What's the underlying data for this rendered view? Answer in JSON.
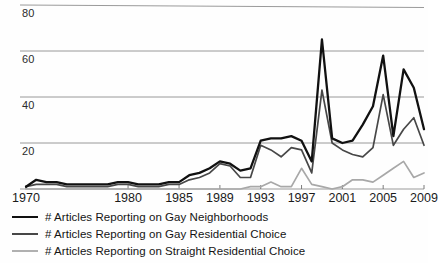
{
  "chart_data": {
    "type": "line",
    "title": "",
    "subtitle": "",
    "xlabel": "",
    "ylabel": "",
    "xlim": [
      1970,
      2009
    ],
    "ylim": [
      0,
      88
    ],
    "grid": true,
    "grid_axis": "y",
    "legend_position": "below-left",
    "x": [
      1970,
      1971,
      1972,
      1973,
      1974,
      1975,
      1976,
      1977,
      1978,
      1979,
      1980,
      1981,
      1982,
      1983,
      1984,
      1985,
      1986,
      1987,
      1988,
      1989,
      1990,
      1991,
      1992,
      1993,
      1994,
      1995,
      1996,
      1997,
      1998,
      1999,
      2000,
      2001,
      2002,
      2003,
      2004,
      2005,
      2006,
      2007,
      2008,
      2009
    ],
    "x_tick_labels": [
      "1970",
      "1980",
      "1985",
      "1989",
      "1993",
      "1997",
      "2001",
      "2005",
      "2009"
    ],
    "x_tick_values": [
      1970,
      1980,
      1985,
      1989,
      1993,
      1997,
      2001,
      2005,
      2009
    ],
    "y_tick_labels": [
      "20",
      "40",
      "60",
      "80"
    ],
    "y_tick_values": [
      20,
      40,
      60,
      80
    ],
    "series": [
      {
        "name": "# Articles Reporting on Gay Neighborhoods",
        "color": "#111111",
        "width": 2.3,
        "values": [
          1,
          4,
          3,
          3,
          2,
          2,
          2,
          2,
          2,
          3,
          3,
          2,
          2,
          2,
          3,
          3,
          6,
          7,
          9,
          12,
          11,
          8,
          9,
          21,
          22,
          22,
          23,
          21,
          12,
          65,
          22,
          20,
          21,
          28,
          36,
          58,
          23,
          52,
          44,
          26
        ]
      },
      {
        "name": "# Articles Reporting on Gay Residential Choice",
        "color": "#474747",
        "width": 1.7,
        "values": [
          1,
          2,
          2,
          2,
          1,
          1,
          1,
          1,
          1,
          2,
          2,
          1,
          1,
          1,
          2,
          2,
          4,
          5,
          7,
          11,
          10,
          5,
          5,
          19,
          17,
          14,
          18,
          17,
          7,
          43,
          20,
          17,
          15,
          14,
          18,
          41,
          19,
          26,
          31,
          19
        ]
      },
      {
        "name": "# Articles Reporting on Straight Residential Choice",
        "color": "#a8a8a8",
        "width": 1.7,
        "values": [
          0,
          0,
          0,
          0,
          0,
          0,
          0,
          0,
          0,
          0,
          0,
          0,
          0,
          0,
          0,
          0,
          0,
          0,
          0,
          0,
          0,
          0,
          1,
          1,
          3,
          1,
          1,
          9,
          2,
          1,
          0,
          1,
          4,
          4,
          3,
          6,
          9,
          12,
          5,
          7
        ]
      }
    ]
  },
  "legend": {
    "items": [
      {
        "label": "# Articles Reporting on Gay Neighborhoods",
        "color": "#111111",
        "width": "2.6px"
      },
      {
        "label": "# Articles Reporting on Gay Residential Choice",
        "color": "#474747",
        "width": "2.2px"
      },
      {
        "label": "# Articles Reporting on Straight Residential Choice",
        "color": "#b0b0b0",
        "width": "2px"
      }
    ]
  },
  "axes": {
    "grid_color": "#8f8f8f",
    "baseline_color": "#9a9a9a"
  }
}
